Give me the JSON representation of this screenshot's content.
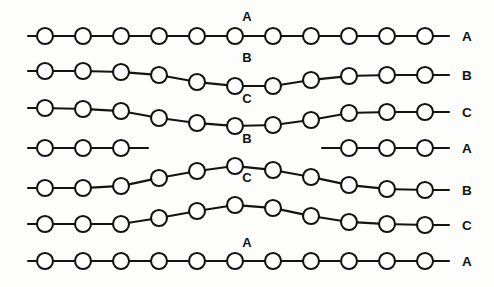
{
  "figure": {
    "background_color": "#fdfdfc",
    "line_color": "#14140f",
    "node_fill": "#ffffff",
    "width": 494,
    "height": 287,
    "node_radius": 8,
    "node_spacing": 38,
    "stub_length": 17
  },
  "chains": [
    {
      "id": "chain-1",
      "center_label": "A",
      "end_label": "A",
      "baseline_y": 36,
      "center_label_x": 247,
      "center_label_y": 21,
      "shape": "flat",
      "node_count": 11,
      "nodes": [
        {
          "x": 45,
          "y": 36
        },
        {
          "x": 83,
          "y": 36
        },
        {
          "x": 121,
          "y": 36
        },
        {
          "x": 159,
          "y": 36
        },
        {
          "x": 197,
          "y": 36
        },
        {
          "x": 235,
          "y": 36
        },
        {
          "x": 273,
          "y": 36
        },
        {
          "x": 311,
          "y": 36
        },
        {
          "x": 349,
          "y": 36
        },
        {
          "x": 387,
          "y": 36
        },
        {
          "x": 425,
          "y": 36
        }
      ],
      "left_stub": {
        "x1": 28,
        "y1": 36,
        "x2": 37,
        "y2": 36
      },
      "right_stub": {
        "x1": 433,
        "y1": 36,
        "x2": 449,
        "y2": 36
      },
      "end_label_x": 462,
      "end_label_y": 41
    },
    {
      "id": "chain-2",
      "center_label": "B",
      "end_label": "B",
      "baseline_y": 74,
      "center_label_x": 247,
      "center_label_y": 62,
      "shape": "valley",
      "node_count": 11,
      "nodes": [
        {
          "x": 45,
          "y": 71
        },
        {
          "x": 83,
          "y": 71
        },
        {
          "x": 121,
          "y": 72
        },
        {
          "x": 159,
          "y": 75
        },
        {
          "x": 197,
          "y": 82
        },
        {
          "x": 235,
          "y": 86
        },
        {
          "x": 273,
          "y": 86
        },
        {
          "x": 311,
          "y": 80
        },
        {
          "x": 349,
          "y": 76
        },
        {
          "x": 387,
          "y": 75
        },
        {
          "x": 425,
          "y": 75
        }
      ],
      "left_stub": {
        "x1": 28,
        "y1": 71,
        "x2": 37,
        "y2": 71
      },
      "right_stub": {
        "x1": 433,
        "y1": 75,
        "x2": 449,
        "y2": 75
      },
      "end_label_x": 462,
      "end_label_y": 80
    },
    {
      "id": "chain-3",
      "center_label": "C",
      "end_label": "C",
      "baseline_y": 112,
      "center_label_x": 247,
      "center_label_y": 103,
      "shape": "valley",
      "node_count": 11,
      "nodes": [
        {
          "x": 45,
          "y": 108
        },
        {
          "x": 83,
          "y": 109
        },
        {
          "x": 121,
          "y": 111
        },
        {
          "x": 159,
          "y": 118
        },
        {
          "x": 197,
          "y": 123
        },
        {
          "x": 235,
          "y": 126
        },
        {
          "x": 273,
          "y": 125
        },
        {
          "x": 311,
          "y": 120
        },
        {
          "x": 349,
          "y": 113
        },
        {
          "x": 387,
          "y": 112
        },
        {
          "x": 425,
          "y": 112
        }
      ],
      "left_stub": {
        "x1": 28,
        "y1": 108,
        "x2": 37,
        "y2": 108
      },
      "right_stub": {
        "x1": 433,
        "y1": 112,
        "x2": 449,
        "y2": 112
      },
      "end_label_x": 462,
      "end_label_y": 117
    },
    {
      "id": "chain-4",
      "center_label": "",
      "end_label": "A",
      "baseline_y": 148,
      "center_label_x": 247,
      "center_label_y": 138,
      "shape": "broken",
      "node_count": 6,
      "nodes": [
        {
          "x": 45,
          "y": 148
        },
        {
          "x": 83,
          "y": 148
        },
        {
          "x": 121,
          "y": 148
        },
        {
          "x": 349,
          "y": 148
        },
        {
          "x": 387,
          "y": 148
        },
        {
          "x": 425,
          "y": 148
        }
      ],
      "left_stub": {
        "x1": 28,
        "y1": 148,
        "x2": 37,
        "y2": 148
      },
      "right_stub": {
        "x1": 433,
        "y1": 148,
        "x2": 449,
        "y2": 148
      },
      "break_left_stub": {
        "x1": 129,
        "y1": 148,
        "x2": 148,
        "y2": 148
      },
      "break_right_stub": {
        "x1": 322,
        "y1": 148,
        "x2": 341,
        "y2": 148
      },
      "end_label_x": 462,
      "end_label_y": 153
    },
    {
      "id": "chain-5",
      "center_label": "B",
      "end_label": "B",
      "baseline_y": 186,
      "center_label_x": 247,
      "center_label_y": 143,
      "shape": "arch",
      "node_count": 11,
      "nodes": [
        {
          "x": 45,
          "y": 188
        },
        {
          "x": 83,
          "y": 188
        },
        {
          "x": 121,
          "y": 186
        },
        {
          "x": 159,
          "y": 178
        },
        {
          "x": 197,
          "y": 171
        },
        {
          "x": 235,
          "y": 166
        },
        {
          "x": 273,
          "y": 170
        },
        {
          "x": 311,
          "y": 177
        },
        {
          "x": 349,
          "y": 185
        },
        {
          "x": 387,
          "y": 189
        },
        {
          "x": 425,
          "y": 190
        }
      ],
      "left_stub": {
        "x1": 28,
        "y1": 188,
        "x2": 37,
        "y2": 188
      },
      "right_stub": {
        "x1": 433,
        "y1": 190,
        "x2": 449,
        "y2": 190
      },
      "end_label_x": 462,
      "end_label_y": 195
    },
    {
      "id": "chain-6",
      "center_label": "C",
      "end_label": "C",
      "baseline_y": 222,
      "center_label_x": 247,
      "center_label_y": 182,
      "shape": "arch",
      "node_count": 11,
      "nodes": [
        {
          "x": 45,
          "y": 224
        },
        {
          "x": 83,
          "y": 224
        },
        {
          "x": 121,
          "y": 224
        },
        {
          "x": 159,
          "y": 218
        },
        {
          "x": 197,
          "y": 211
        },
        {
          "x": 235,
          "y": 205
        },
        {
          "x": 273,
          "y": 208
        },
        {
          "x": 311,
          "y": 216
        },
        {
          "x": 349,
          "y": 222
        },
        {
          "x": 387,
          "y": 224
        },
        {
          "x": 425,
          "y": 225
        }
      ],
      "left_stub": {
        "x1": 28,
        "y1": 224,
        "x2": 37,
        "y2": 224
      },
      "right_stub": {
        "x1": 433,
        "y1": 225,
        "x2": 449,
        "y2": 225
      },
      "end_label_x": 462,
      "end_label_y": 230
    },
    {
      "id": "chain-7",
      "center_label": "A",
      "end_label": "A",
      "baseline_y": 261,
      "center_label_x": 247,
      "center_label_y": 247,
      "shape": "flat",
      "node_count": 11,
      "nodes": [
        {
          "x": 45,
          "y": 261
        },
        {
          "x": 83,
          "y": 261
        },
        {
          "x": 121,
          "y": 261
        },
        {
          "x": 159,
          "y": 261
        },
        {
          "x": 197,
          "y": 261
        },
        {
          "x": 235,
          "y": 261
        },
        {
          "x": 273,
          "y": 261
        },
        {
          "x": 311,
          "y": 261
        },
        {
          "x": 349,
          "y": 261
        },
        {
          "x": 387,
          "y": 261
        },
        {
          "x": 425,
          "y": 261
        }
      ],
      "left_stub": {
        "x1": 28,
        "y1": 261,
        "x2": 37,
        "y2": 261
      },
      "right_stub": {
        "x1": 433,
        "y1": 261,
        "x2": 449,
        "y2": 261
      },
      "end_label_x": 462,
      "end_label_y": 266
    }
  ]
}
